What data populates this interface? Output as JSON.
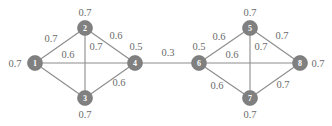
{
  "figure": {
    "type": "graph-diagram",
    "background_color": "#ffffff",
    "node_fill_color": "#808080",
    "node_text_color": "#ffffff",
    "edge_color": "#8c8c8c",
    "label_color": "#6b6b6b"
  },
  "nodes": [
    {
      "id": "1",
      "label": "1",
      "cx": 35,
      "cy": 63,
      "r": 7.5,
      "weight": "0.7",
      "weight_x": 15,
      "weight_y": 63
    },
    {
      "id": "2",
      "label": "2",
      "cx": 85,
      "cy": 28,
      "r": 7.5,
      "weight": "0.7",
      "weight_x": 85,
      "weight_y": 12
    },
    {
      "id": "3",
      "label": "3",
      "cx": 85,
      "cy": 98,
      "r": 7.5,
      "weight": "0.7",
      "weight_x": 85,
      "weight_y": 114
    },
    {
      "id": "4",
      "label": "4",
      "cx": 135,
      "cy": 63,
      "r": 7.5,
      "weight": "0.5",
      "weight_x": 136,
      "weight_y": 46
    },
    {
      "id": "5",
      "label": "5",
      "cx": 250,
      "cy": 28,
      "r": 7.5,
      "weight": "0.7",
      "weight_x": 250,
      "weight_y": 12
    },
    {
      "id": "6",
      "label": "6",
      "cx": 199,
      "cy": 63,
      "r": 7.5,
      "weight": "0.5",
      "weight_x": 199,
      "weight_y": 46
    },
    {
      "id": "7",
      "label": "7",
      "cx": 250,
      "cy": 98,
      "r": 7.5,
      "weight": "0.7",
      "weight_x": 250,
      "weight_y": 114
    },
    {
      "id": "8",
      "label": "8",
      "cx": 300,
      "cy": 63,
      "r": 7.5,
      "weight": "0.7",
      "weight_x": 318,
      "weight_y": 63
    }
  ],
  "edges": [
    {
      "id": "e-1-2",
      "from": "1",
      "to": "2",
      "weight": "0.7",
      "label_x": 51,
      "label_y": 38
    },
    {
      "id": "e-1-4",
      "from": "1",
      "to": "4",
      "weight": "0.6",
      "label_x": 68,
      "label_y": 54
    },
    {
      "id": "e-1-3",
      "from": "1",
      "to": "3",
      "weight": "",
      "label_x": 0,
      "label_y": 0
    },
    {
      "id": "e-2-3",
      "from": "2",
      "to": "3",
      "weight": "0.7",
      "label_x": 96,
      "label_y": 46
    },
    {
      "id": "e-2-4",
      "from": "2",
      "to": "4",
      "weight": "0.6",
      "label_x": 116,
      "label_y": 35
    },
    {
      "id": "e-3-4",
      "from": "3",
      "to": "4",
      "weight": "0.6",
      "label_x": 119,
      "label_y": 82
    },
    {
      "id": "e-4-6",
      "from": "4",
      "to": "6",
      "weight": "0.3",
      "label_x": 168,
      "label_y": 52
    },
    {
      "id": "e-6-5",
      "from": "6",
      "to": "5",
      "weight": "0.6",
      "label_x": 219,
      "label_y": 36
    },
    {
      "id": "e-6-8",
      "from": "6",
      "to": "8",
      "weight": "0.6",
      "label_x": 232,
      "label_y": 54
    },
    {
      "id": "e-6-7",
      "from": "6",
      "to": "7",
      "weight": "0.6",
      "label_x": 217,
      "label_y": 85
    },
    {
      "id": "e-5-7",
      "from": "5",
      "to": "7",
      "weight": "0.7",
      "label_x": 261,
      "label_y": 46
    },
    {
      "id": "e-5-8",
      "from": "5",
      "to": "8",
      "weight": "0.7",
      "label_x": 282,
      "label_y": 35
    },
    {
      "id": "e-7-8",
      "from": "7",
      "to": "8",
      "weight": "0.7",
      "label_x": 283,
      "label_y": 84
    }
  ]
}
